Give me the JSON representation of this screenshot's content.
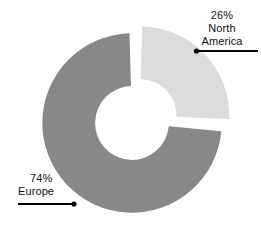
{
  "chart_data": {
    "type": "pie",
    "variant": "donut",
    "title": "",
    "subtitle": "",
    "xlabel": "",
    "ylabel": "",
    "grid": false,
    "legend_position": "none",
    "labels_as_callouts": true,
    "total": 100,
    "units": "%",
    "categories": [
      "North America",
      "Europe"
    ],
    "values": [
      26,
      74
    ],
    "slices": [
      {
        "name": "North America",
        "label_percent": "26%",
        "label_line1": "26%",
        "label_line2": "North",
        "label_line3": "America",
        "value": 26,
        "color": "#dcdcdc",
        "exploded": true,
        "start_angle_deg": 0,
        "end_angle_deg": 93.6
      },
      {
        "name": "Europe",
        "label_percent": "74%",
        "label_line1": "74%",
        "label_line2": "Europe",
        "label_line3": "",
        "value": 74,
        "color": "#888888",
        "exploded": false,
        "start_angle_deg": 93.6,
        "end_angle_deg": 360
      }
    ],
    "annotations": [
      {
        "name": "north-america-callout",
        "text_lines": [
          "26%",
          "North",
          "America"
        ],
        "leader_from_x": 258,
        "leader_from_y": 51,
        "leader_to_x": 197,
        "leader_to_y": 51
      },
      {
        "name": "europe-callout",
        "text_lines": [
          "74%",
          "Europe"
        ],
        "leader_from_x": 18,
        "leader_from_y": 204,
        "leader_to_x": 74,
        "leader_to_y": 204
      }
    ]
  },
  "colors": {
    "background": "#ffffff",
    "slice_light": "#dcdcdc",
    "slice_dark": "#888888",
    "leader": "#000000",
    "text": "#111111"
  },
  "callouts": {
    "north_america": {
      "line1": "26%",
      "line2": "North",
      "line3": "America"
    },
    "europe": {
      "line1": "74%",
      "line2": "Europe"
    }
  }
}
